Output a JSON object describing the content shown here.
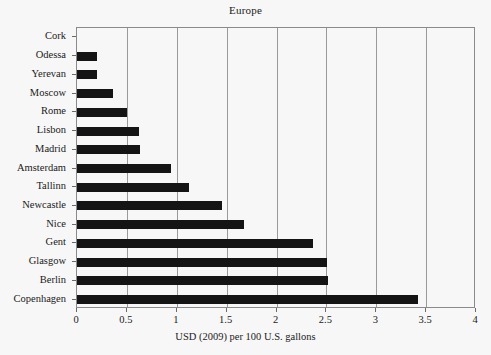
{
  "chart_data": {
    "type": "bar",
    "orientation": "horizontal",
    "title": "Europe",
    "xlabel": "USD (2009) per 100 U.S. gallons",
    "ylabel": "",
    "xlim": [
      0,
      4
    ],
    "ylim": null,
    "grid": "vertical",
    "legend": null,
    "bar_color": "#141414",
    "background_color": "#f7f7f7",
    "xticks": [
      0,
      0.5,
      1,
      1.5,
      2,
      2.5,
      3,
      3.5,
      4
    ],
    "xtick_labels": [
      "0",
      "0.5",
      "1",
      "1.5",
      "2",
      "2.5",
      "3",
      "3.5",
      "4"
    ],
    "categories": [
      "Cork",
      "Odessa",
      "Yerevan",
      "Moscow",
      "Rome",
      "Lisbon",
      "Madrid",
      "Amsterdam",
      "Tallinn",
      "Newcastle",
      "Nice",
      "Gent",
      "Glasgow",
      "Berlin",
      "Copenhagen"
    ],
    "values": [
      0,
      0.2,
      0.2,
      0.36,
      0.5,
      0.62,
      0.63,
      0.94,
      1.12,
      1.45,
      1.67,
      2.37,
      2.51,
      2.52,
      3.42
    ]
  }
}
